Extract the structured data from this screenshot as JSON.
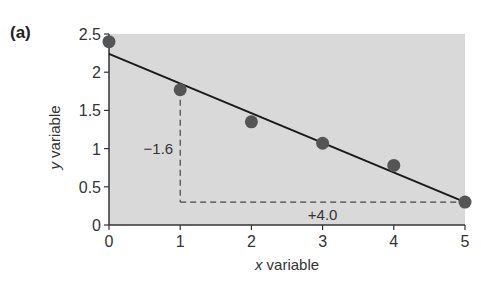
{
  "panel_label": "(a)",
  "chart_data": {
    "type": "scatter",
    "title": "",
    "xlabel": "x variable",
    "ylabel": "y variable",
    "xlim": [
      0,
      5
    ],
    "ylim": [
      0,
      2.5
    ],
    "x_ticks": [
      0,
      1,
      2,
      3,
      4,
      5
    ],
    "y_ticks": [
      0,
      0.5,
      1,
      1.5,
      2,
      2.5
    ],
    "y_tick_labels": [
      "0",
      "0.5",
      "1",
      "1.5",
      "2",
      "2.5"
    ],
    "grid": false,
    "series": [
      {
        "name": "data points",
        "type": "scatter",
        "x": [
          0,
          1,
          2,
          3,
          4,
          5
        ],
        "y": [
          2.4,
          1.77,
          1.35,
          1.07,
          0.78,
          0.3
        ]
      },
      {
        "name": "regression line",
        "type": "line",
        "x": [
          0,
          5
        ],
        "y": [
          2.24,
          0.3
        ]
      }
    ],
    "annotations": [
      {
        "text": "−1.6",
        "label": "rise",
        "x": 0.85,
        "y": 1.0
      },
      {
        "text": "+4.0",
        "label": "run",
        "x": 3.0,
        "y": 0.15
      }
    ],
    "slope_triangle": {
      "vertical": {
        "x": 1,
        "y_from": 1.77,
        "y_to": 0.3
      },
      "horizontal": {
        "y": 0.3,
        "x_from": 1,
        "x_to": 5
      }
    },
    "colors": {
      "plot_background": "#d9d9d9",
      "points": "#555555",
      "line": "#1a1a1a",
      "axis": "#333333"
    }
  }
}
